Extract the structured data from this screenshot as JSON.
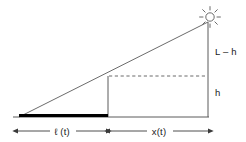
{
  "figure": {
    "background_color": "#ffffff",
    "line_color": "#4d4d4d",
    "shadow_color": "#000000",
    "text_color": "#1a1a1a"
  },
  "labels": {
    "upper_vertical": "L – h",
    "lower_vertical": "h",
    "shadow_dimension": "ℓ (t)",
    "distance_dimension": "x(t)"
  },
  "icons": {
    "sun": "sun-icon"
  },
  "geometry": {
    "ground_y": 117,
    "ground_x_start": 13,
    "ground_x_end": 209,
    "origin_x": 19,
    "pole_x": 108,
    "pole_top_y": 76,
    "light_x": 208,
    "light_top_y": 22,
    "sun_center_x": 210,
    "sun_center_y": 17,
    "sun_radius": 4.2,
    "dim_line_y": 131,
    "dim_left_start": 18,
    "dim_left_end": 106,
    "dim_right_start": 110,
    "dim_right_end": 208,
    "shadow_y": 115.5,
    "shadow_x_start": 19,
    "shadow_x_end": 108,
    "dashed_y": 76,
    "dashed_x_start": 109,
    "dashed_x_end": 207
  },
  "label_positions": {
    "upper_vertical_x": 215,
    "upper_vertical_y": 55,
    "lower_vertical_x": 215,
    "lower_vertical_y": 96,
    "shadow_dimension_x": 62,
    "shadow_dimension_y": 134.5,
    "distance_dimension_x": 159,
    "distance_dimension_y": 134.5
  }
}
